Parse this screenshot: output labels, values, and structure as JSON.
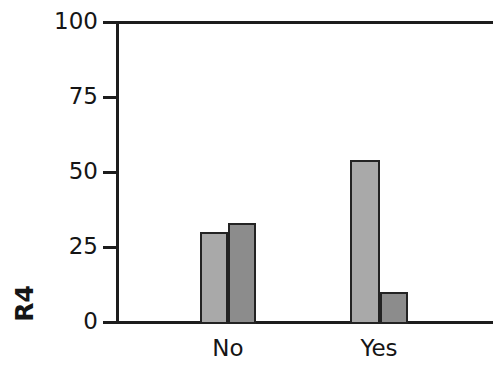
{
  "chart_data": {
    "type": "bar",
    "title": "",
    "subtitle": "",
    "xlabel": "",
    "ylabel": "R4",
    "categories": [
      "No",
      "Yes"
    ],
    "series": [
      {
        "name": "series-1",
        "color": "#a9a9a9",
        "values": [
          30,
          54
        ]
      },
      {
        "name": "series-2",
        "color": "#8c8c8c",
        "values": [
          33,
          10
        ]
      }
    ],
    "ylim": [
      0,
      100
    ],
    "yticks": [
      0,
      25,
      50,
      75,
      100
    ],
    "ytick_labels": [
      "0",
      "25",
      "50",
      "75",
      "100"
    ],
    "grid": false,
    "legend": "none",
    "annotations": []
  },
  "axis": {
    "y_title": "R4",
    "tick_0": "0",
    "tick_25": "25",
    "tick_50": "50",
    "tick_75": "75",
    "tick_100": "100"
  },
  "categories": {
    "no": "No",
    "yes": "Yes"
  },
  "colors": {
    "bar_light": "#a9a9a9",
    "bar_dark": "#8c8c8c",
    "axis": "#1d1d1d",
    "bar_border": "#232323",
    "background": "#ffffff",
    "text": "#151515"
  }
}
